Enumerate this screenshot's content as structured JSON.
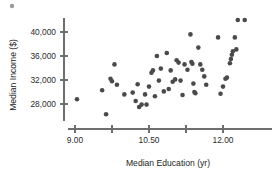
{
  "chart_data": {
    "type": "scatter",
    "title": "",
    "xlabel": "Median Education (yr)",
    "ylabel": "Median Income ($)",
    "xlim": [
      8.55,
      12.75
    ],
    "ylim": [
      25200,
      42400
    ],
    "xticks": [
      9.0,
      9.75,
      10.5,
      11.25,
      12.0
    ],
    "xticklabels": [
      "9.00",
      "",
      "10.50",
      "",
      "12.00"
    ],
    "yticks": [
      28000,
      32000,
      36000,
      40000
    ],
    "yticklabels": [
      "28,000",
      "32,000",
      "36,000",
      "40,000"
    ],
    "grid": false,
    "legend": null,
    "marker_color": "#4a4a4a",
    "axis_color": "#6e6e6e",
    "points": [
      {
        "x": 9.04,
        "y": 28800
      },
      {
        "x": 9.55,
        "y": 30300
      },
      {
        "x": 9.63,
        "y": 26300
      },
      {
        "x": 9.72,
        "y": 32200
      },
      {
        "x": 9.75,
        "y": 31800
      },
      {
        "x": 9.8,
        "y": 34600
      },
      {
        "x": 9.85,
        "y": 31200
      },
      {
        "x": 10.0,
        "y": 29600
      },
      {
        "x": 10.17,
        "y": 29900
      },
      {
        "x": 10.23,
        "y": 28500
      },
      {
        "x": 10.27,
        "y": 31300
      },
      {
        "x": 10.3,
        "y": 27500
      },
      {
        "x": 10.35,
        "y": 27900
      },
      {
        "x": 10.42,
        "y": 29600
      },
      {
        "x": 10.45,
        "y": 27900
      },
      {
        "x": 10.5,
        "y": 30900
      },
      {
        "x": 10.55,
        "y": 33200
      },
      {
        "x": 10.58,
        "y": 33600
      },
      {
        "x": 10.62,
        "y": 29300
      },
      {
        "x": 10.66,
        "y": 36000
      },
      {
        "x": 10.7,
        "y": 31900
      },
      {
        "x": 10.74,
        "y": 33900
      },
      {
        "x": 10.8,
        "y": 30100
      },
      {
        "x": 10.86,
        "y": 36500
      },
      {
        "x": 10.9,
        "y": 30500
      },
      {
        "x": 10.94,
        "y": 33600
      },
      {
        "x": 10.98,
        "y": 31700
      },
      {
        "x": 11.03,
        "y": 32100
      },
      {
        "x": 11.06,
        "y": 35300
      },
      {
        "x": 11.1,
        "y": 34900
      },
      {
        "x": 11.14,
        "y": 31900
      },
      {
        "x": 11.18,
        "y": 29500
      },
      {
        "x": 11.22,
        "y": 34600
      },
      {
        "x": 11.28,
        "y": 33700
      },
      {
        "x": 11.34,
        "y": 39600
      },
      {
        "x": 11.36,
        "y": 35000
      },
      {
        "x": 11.38,
        "y": 34700
      },
      {
        "x": 11.4,
        "y": 31400
      },
      {
        "x": 11.42,
        "y": 30000
      },
      {
        "x": 11.44,
        "y": 29800
      },
      {
        "x": 11.5,
        "y": 37400
      },
      {
        "x": 11.54,
        "y": 34600
      },
      {
        "x": 11.58,
        "y": 33700
      },
      {
        "x": 11.62,
        "y": 32600
      },
      {
        "x": 11.66,
        "y": 31200
      },
      {
        "x": 11.9,
        "y": 39100
      },
      {
        "x": 11.95,
        "y": 29700
      },
      {
        "x": 12.0,
        "y": 30900
      },
      {
        "x": 12.05,
        "y": 32200
      },
      {
        "x": 12.08,
        "y": 32400
      },
      {
        "x": 12.14,
        "y": 34800
      },
      {
        "x": 12.16,
        "y": 35500
      },
      {
        "x": 12.18,
        "y": 36200
      },
      {
        "x": 12.2,
        "y": 36800
      },
      {
        "x": 12.24,
        "y": 39100
      },
      {
        "x": 12.27,
        "y": 37100
      },
      {
        "x": 12.3,
        "y": 42000
      },
      {
        "x": 12.44,
        "y": 42000
      }
    ]
  }
}
